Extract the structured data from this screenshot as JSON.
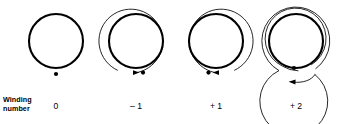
{
  "figure": {
    "kind": "winding-number-diagram",
    "background_color": "#ffffff",
    "stroke_color": "#000000",
    "row_label": {
      "line1": "Winding",
      "line2": "number"
    },
    "panels": [
      {
        "id": "panel-0",
        "winding_number_label": "0",
        "winding_number_value": 0,
        "center_x": 56,
        "center_y": 41,
        "core_radius": 27,
        "loop_count": 0,
        "arrow_direction": "none",
        "marker_dot": {
          "x": 56,
          "y": 74,
          "r": 2.1
        }
      },
      {
        "id": "panel-minus-1",
        "winding_number_label": "– 1",
        "winding_number_value": -1,
        "center_x": 136,
        "center_y": 41,
        "core_radius": 27,
        "loop_count": 1,
        "arrow_direction": "right",
        "marker_dot": {
          "x": 139,
          "y": 71.5,
          "r": 2.1
        }
      },
      {
        "id": "panel-plus-1",
        "winding_number_label": "+ 1",
        "winding_number_value": 1,
        "center_x": 216,
        "center_y": 41,
        "core_radius": 27,
        "loop_count": 1,
        "arrow_direction": "left",
        "marker_dot": {
          "x": 210,
          "y": 71.5,
          "r": 2.1
        }
      },
      {
        "id": "panel-plus-2",
        "winding_number_label": "+ 2",
        "winding_number_value": 2,
        "center_x": 296,
        "center_y": 41,
        "core_radius": 27,
        "loop_count": 2,
        "arrow_direction": "left",
        "marker_dot": {
          "x": 294,
          "y": 68,
          "r": 2.1
        }
      }
    ],
    "number_label_positions": [
      {
        "left": 36,
        "top": 101,
        "width": 40
      },
      {
        "left": 116,
        "top": 101,
        "width": 40
      },
      {
        "left": 196,
        "top": 101,
        "width": 40
      },
      {
        "left": 276,
        "top": 101,
        "width": 40
      }
    ]
  }
}
